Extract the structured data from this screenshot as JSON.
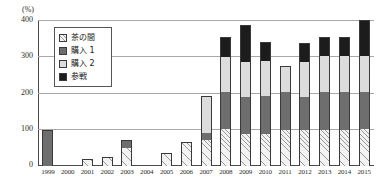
{
  "chart_data": {
    "type": "bar",
    "stacked": true,
    "title": "",
    "subtitle": "",
    "xlabel": "",
    "ylabel": "",
    "unit_label": "(%)",
    "ylim": [
      0,
      400
    ],
    "yticks": [
      0,
      100,
      200,
      300,
      400
    ],
    "ytick_labels": [
      "0",
      "100",
      "200",
      "300",
      "400"
    ],
    "grid": true,
    "legend_position": "upper-left-inside",
    "categories": [
      "1999",
      "2000",
      "2001",
      "2002",
      "2003",
      "2004",
      "2005",
      "2006",
      "2007",
      "2008",
      "2009",
      "2010",
      "2011",
      "2012",
      "2013",
      "2014",
      "2015"
    ],
    "series": [
      {
        "name": "茶の間",
        "pattern": "hatch",
        "color": "#f2f2f2",
        "values": [
          0,
          0,
          18,
          25,
          50,
          0,
          35,
          67,
          72,
          103,
          88,
          88,
          100,
          100,
          100,
          100,
          103
        ]
      },
      {
        "name": "購入 1",
        "pattern": "dark",
        "color": "#6e6e6e",
        "values": [
          100,
          0,
          0,
          0,
          22,
          0,
          0,
          0,
          18,
          100,
          102,
          105,
          103,
          90,
          105,
          105,
          100
        ]
      },
      {
        "name": "購入 2",
        "pattern": "light",
        "color": "#dcdcdc",
        "values": [
          0,
          0,
          0,
          0,
          0,
          0,
          0,
          0,
          103,
          97,
          97,
          97,
          72,
          97,
          98,
          98,
          100
        ]
      },
      {
        "name": "参戦",
        "pattern": "black",
        "color": "#1c1c1c",
        "values": [
          0,
          0,
          0,
          0,
          0,
          0,
          0,
          0,
          0,
          57,
          103,
          52,
          0,
          53,
          54,
          54,
          100
        ]
      }
    ],
    "totals": [
      100,
      0,
      18,
      25,
      72,
      0,
      35,
      67,
      193,
      357,
      390,
      342,
      275,
      340,
      357,
      357,
      403
    ]
  }
}
